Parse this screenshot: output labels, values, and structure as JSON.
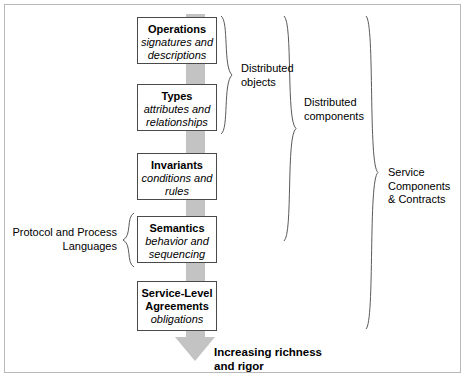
{
  "diagram": {
    "title_visible": false,
    "arrow": {
      "name": "increasing-richness-arrow",
      "direction": "down",
      "color": "#c3c3c3"
    },
    "nodes": [
      {
        "id": "operations",
        "title": "Operations",
        "subtitle": "signatures and\ndescriptions"
      },
      {
        "id": "types",
        "title": "Types",
        "subtitle": "attributes and\nrelationships"
      },
      {
        "id": "invariants",
        "title": "Invariants",
        "subtitle": "conditions and\nrules"
      },
      {
        "id": "semantics",
        "title": "Semantics",
        "subtitle": "behavior and\nsequencing"
      },
      {
        "id": "sla",
        "title": "Service-Level\nAgreements",
        "subtitle": "obligations"
      }
    ],
    "labels": {
      "distributed_objects": "Distributed\nobjects",
      "distributed_components": "Distributed\ncomponents",
      "service_components_contracts": "Service\nComponents\n& Contracts",
      "protocol_process_languages": "Protocol and Process\nLanguages",
      "increasing_richness": "Increasing richness\nand rigor"
    },
    "colors": {
      "arrow": "#c3c3c3",
      "box_border": "#4a4a4a",
      "brace": "#5a5a5a",
      "frame": "#b8b8b8",
      "text": "#000000",
      "background": "#ffffff"
    }
  }
}
